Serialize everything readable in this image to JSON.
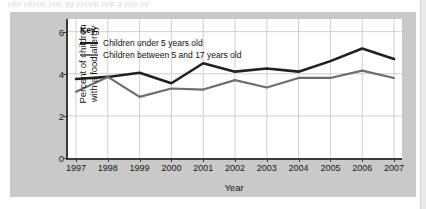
{
  "page": {
    "top_bleed_text": "ppp    ppppp  ppp  gg  ppppp  ppp g ppp  pp"
  },
  "chart_data": {
    "type": "line",
    "title": "",
    "xlabel": "Year",
    "ylabel_lines": [
      "Percent of children",
      "with a food allergy"
    ],
    "ylabel": "Percent of children with a food allergy",
    "categories": [
      "1997",
      "1998",
      "1999",
      "2000",
      "2001",
      "2002",
      "2003",
      "2004",
      "2005",
      "2006",
      "2007"
    ],
    "x": [
      1997,
      1998,
      1999,
      2000,
      2001,
      2002,
      2003,
      2004,
      2005,
      2006,
      2007
    ],
    "ylim": [
      0,
      6.6
    ],
    "yticks": [
      0,
      2,
      4,
      6
    ],
    "ytick_labels": [
      "0",
      "2",
      "4",
      "6"
    ],
    "grid": true,
    "legend_position": "top-left-inside",
    "legend_title": "Key",
    "series": [
      {
        "name": "Children under 5 years old",
        "color": "#231f20",
        "width": 2.6,
        "values": [
          3.75,
          3.85,
          4.05,
          3.55,
          4.5,
          4.1,
          4.25,
          4.1,
          4.6,
          5.2,
          4.7
        ]
      },
      {
        "name": "Children between 5 and 17 years old",
        "color": "#6d6d6d",
        "width": 2.2,
        "values": [
          3.15,
          3.85,
          2.9,
          3.3,
          3.25,
          3.7,
          3.35,
          3.8,
          3.8,
          4.15,
          3.8
        ]
      }
    ]
  },
  "colors": {
    "panel_background": "#c9c9c9",
    "plot_background": "#ffffff",
    "axis": "#3a3a3a",
    "grid": "#cfcfcf",
    "series_dark": "#231f20",
    "series_grey": "#6d6d6d"
  }
}
